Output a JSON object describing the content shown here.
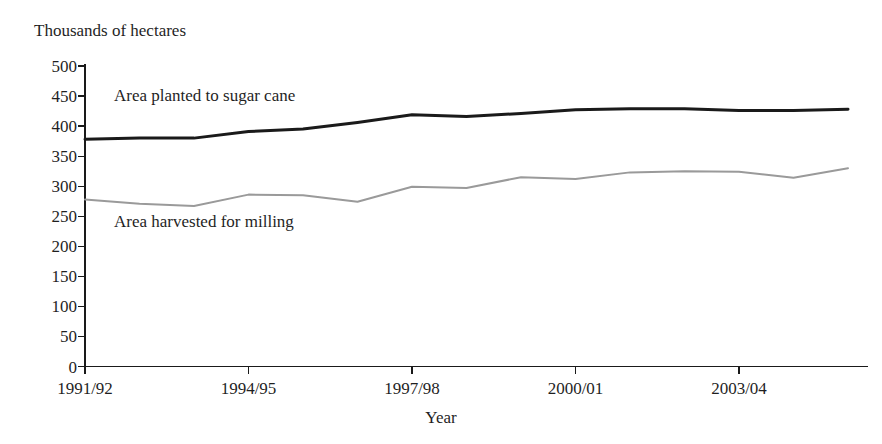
{
  "chart_data": {
    "type": "line",
    "title": "",
    "ylabel": "Thousands of hectares",
    "xlabel": "Year",
    "ylim": [
      0,
      500
    ],
    "y_ticks": [
      0,
      50,
      100,
      150,
      200,
      250,
      300,
      350,
      400,
      450,
      500
    ],
    "y_tick_labels": [
      "0",
      "50",
      "100",
      "150",
      "200",
      "250",
      "300",
      "350",
      "400",
      "450",
      "500"
    ],
    "grid": false,
    "legend_position": "inline-annotation",
    "x": [
      "1991/92",
      "1992/93",
      "1993/94",
      "1994/95",
      "1995/96",
      "1996/97",
      "1997/98",
      "1998/99",
      "1999/00",
      "2000/01",
      "2001/02",
      "2002/03",
      "2003/04",
      "2004/05",
      "2005/06"
    ],
    "x_tick_labels": [
      "1991/92",
      "1994/95",
      "1997/98",
      "2000/01",
      "2003/04"
    ],
    "x_tick_indices": [
      0,
      3,
      6,
      9,
      12
    ],
    "series": [
      {
        "name": "Area planted to sugar cane",
        "color": "#1a1a1a",
        "stroke_width": 3.0,
        "values": [
          378,
          380,
          380,
          391,
          395,
          406,
          419,
          416,
          421,
          427,
          429,
          429,
          426,
          426,
          428
        ]
      },
      {
        "name": "Area harvested for milling",
        "color": "#9a9a9a",
        "stroke_width": 2.0,
        "values": [
          278,
          271,
          267,
          286,
          285,
          274,
          299,
          297,
          315,
          312,
          323,
          325,
          324,
          314,
          330
        ]
      }
    ],
    "annotations": [
      {
        "name": "Area planted to sugar cane",
        "text": "Area planted to sugar cane",
        "x_px": 114,
        "y_px": 101
      },
      {
        "name": "Area harvested for milling",
        "text": "Area harvested for milling",
        "x_px": 114,
        "y_px": 227
      }
    ]
  },
  "axes": {
    "y_axis_title": "Thousands of hectares",
    "x_axis_title": "Year"
  },
  "colors": {
    "planted_line": "#1a1a1a",
    "harvested_line": "#9a9a9a",
    "axis": "#1a1a1a",
    "text": "#1f1f1f",
    "background": "#ffffff"
  }
}
